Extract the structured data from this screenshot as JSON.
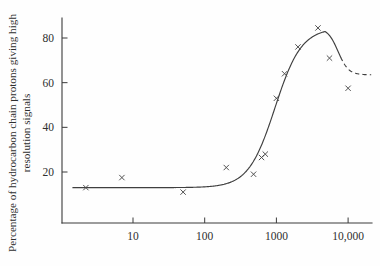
{
  "chart_data": {
    "type": "scatter",
    "title": "",
    "subtitle": "",
    "xlabel": "",
    "ylabel": "Percentage of hydrocarbon chain protons giving high resolution signals",
    "xscale": "log",
    "yscale": "linear",
    "xlim": [
      1.3,
      22000
    ],
    "ylim": [
      0,
      92
    ],
    "grid": false,
    "legend": null,
    "x_ticks": [
      10,
      100,
      1000,
      10000
    ],
    "x_tick_labels": [
      "10",
      "100",
      "1000",
      "10,000"
    ],
    "y_ticks": [
      20,
      40,
      60,
      80
    ],
    "y_tick_labels": [
      "20",
      "40",
      "60",
      "80"
    ],
    "marker": "x",
    "series": [
      {
        "name": "measured points",
        "marker": "x",
        "x": [
          2.2,
          7,
          50,
          200,
          480,
          620,
          700,
          1000,
          1300,
          2000,
          3800,
          5500,
          10000
        ],
        "y": [
          13,
          17.5,
          11,
          22,
          19,
          26.5,
          28,
          53,
          64,
          76,
          84.5,
          71,
          57.5
        ]
      }
    ],
    "fitted_curve": {
      "name": "fitted sigmoid with maximum and dashed plateau",
      "style": "solid then dashed",
      "description": "Flat near 13% below x=100, rises steeply between x=500 and x=2000, peaks at about 84.5% near x=3800, falls to a plateau of about 63.5% beyond x=8000 where it is drawn dashed",
      "plateau_low": 13,
      "peak_value": 84.5,
      "peak_x": 3800,
      "plateau_high": 63.5,
      "dashed_from_x": 8000
    },
    "annotations": []
  },
  "figure": {
    "background_color": "#fefefe",
    "ink_color": "#3a3a3a"
  }
}
